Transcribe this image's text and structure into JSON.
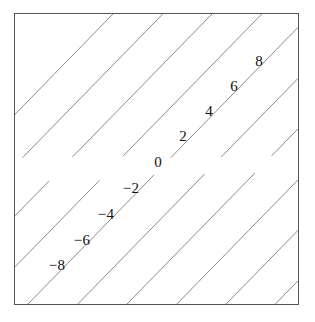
{
  "figure": {
    "background_color": "#ffffff",
    "frame_color": "#555555",
    "frame": {
      "x": 14,
      "y": 13,
      "width": 285,
      "height": 292
    }
  },
  "chart_data": {
    "type": "line",
    "subtype": "contour",
    "title": "",
    "subtitle": "",
    "xlabel": "",
    "ylabel": "",
    "xlim": [
      0,
      1
    ],
    "ylim": [
      0,
      1
    ],
    "xticks": [],
    "yticks": [],
    "xticklabels": [],
    "yticklabels": [],
    "grid": false,
    "legend": false,
    "legend_position": "none",
    "axis_visible": false,
    "frame_visible": true,
    "line_color": "#8a8a8a",
    "line_width": 1,
    "label_color": "#111111",
    "contour_levels": [
      -8,
      -6,
      -4,
      -2,
      0,
      2,
      4,
      6,
      8
    ],
    "contour_level_step": 2,
    "contour_orientation": "anti-diagonal",
    "contour_slope": -1,
    "annotations": [
      {
        "text": "8",
        "level": 8,
        "x": 258,
        "y": 60
      },
      {
        "text": "6",
        "level": 6,
        "x": 233,
        "y": 85
      },
      {
        "text": "4",
        "level": 4,
        "x": 208,
        "y": 110
      },
      {
        "text": "2",
        "level": 2,
        "x": 182,
        "y": 135
      },
      {
        "text": "0",
        "level": 0,
        "x": 157,
        "y": 161
      },
      {
        "text": "−2",
        "level": -2,
        "x": 130,
        "y": 187
      },
      {
        "text": "−4",
        "level": -4,
        "x": 105,
        "y": 213
      },
      {
        "text": "−6",
        "level": -6,
        "x": 81,
        "y": 239
      },
      {
        "text": "−8",
        "level": -8,
        "x": 56,
        "y": 264
      }
    ],
    "contour_lines": [
      {
        "level": 8,
        "label": "8",
        "c": 0.873
      },
      {
        "level": 6,
        "label": "6",
        "c": 0.786
      },
      {
        "level": 4,
        "label": "4",
        "c": 0.698
      },
      {
        "level": 2,
        "label": "2",
        "c": 0.611
      },
      {
        "level": 0,
        "label": "0",
        "c": 0.523
      },
      {
        "level": -2,
        "label": "−2",
        "c": 0.436
      },
      {
        "level": -4,
        "label": "−4",
        "c": 0.348
      },
      {
        "level": -6,
        "label": "−6",
        "c": 0.261
      },
      {
        "level": -8,
        "label": "−8",
        "c": 0.173
      }
    ]
  }
}
